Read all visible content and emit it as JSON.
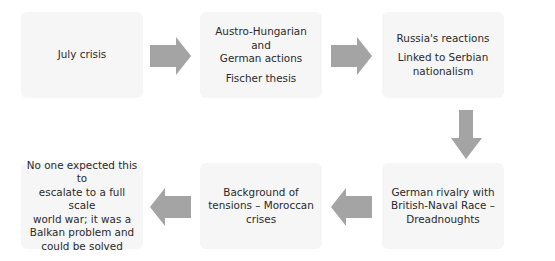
{
  "diagram": {
    "type": "flowchart",
    "arrow_color": "#a4a4a4",
    "box_color": "#f6f6f6",
    "nodes": [
      {
        "id": "july-crisis",
        "lines": [
          "July crisis"
        ]
      },
      {
        "id": "austro-hungarian-german-actions",
        "lines": [
          "Austro-Hungarian and",
          "German actions"
        ],
        "sub_lines": [
          "Fischer thesis"
        ]
      },
      {
        "id": "russias-reactions",
        "lines": [
          "Russia's reactions"
        ],
        "sub_lines": [
          "Linked to Serbian",
          "nationalism"
        ]
      },
      {
        "id": "german-british-naval-race",
        "lines": [
          "German rivalry with",
          "British-Naval Race –",
          "Dreadnoughts"
        ]
      },
      {
        "id": "background-of-tensions",
        "lines": [
          "Background of",
          "tensions – Moroccan",
          "crises"
        ]
      },
      {
        "id": "no-one-expected",
        "lines": [
          "No one expected this to",
          "escalate to a full scale",
          "world war; it was a",
          "Balkan problem and",
          "could be solved"
        ]
      }
    ],
    "edges": [
      {
        "from": "july-crisis",
        "to": "austro-hungarian-german-actions",
        "direction": "right"
      },
      {
        "from": "austro-hungarian-german-actions",
        "to": "russias-reactions",
        "direction": "right"
      },
      {
        "from": "russias-reactions",
        "to": "german-british-naval-race",
        "direction": "down"
      },
      {
        "from": "german-british-naval-race",
        "to": "background-of-tensions",
        "direction": "left"
      },
      {
        "from": "background-of-tensions",
        "to": "no-one-expected",
        "direction": "left"
      }
    ]
  }
}
